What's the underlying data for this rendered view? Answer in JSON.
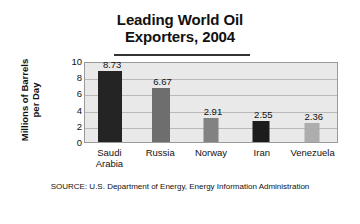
{
  "chart_data": {
    "type": "bar",
    "title": "Leading World Oil Exporters, 2004",
    "title_lines": [
      "Leading World Oil",
      "Exporters, 2004"
    ],
    "categories": [
      "Saudi Arabia",
      "Russia",
      "Norway",
      "Iran",
      "Venezuela"
    ],
    "category_lines": [
      [
        "Saudi",
        "Arabia"
      ],
      [
        "Russia"
      ],
      [
        "Norway"
      ],
      [
        "Iran"
      ],
      [
        "Venezuela"
      ]
    ],
    "values": [
      8.73,
      6.67,
      2.91,
      2.55,
      2.36
    ],
    "value_labels": [
      "8.73",
      "6.67",
      "2.91",
      "2.55",
      "2.36"
    ],
    "bar_colors": [
      "#242424",
      "#6e6e6e",
      "#828282",
      "#1c1c1c",
      "#adadad"
    ],
    "xlabel": "",
    "ylabel": "Millions of Barrels per Day",
    "ylabel_lines": [
      "Millions of Barrels",
      "per Day"
    ],
    "ylim": [
      0,
      10
    ],
    "yticks": [
      10,
      8,
      6,
      4,
      2,
      0
    ],
    "ytick_labels": [
      "10",
      "8",
      "6",
      "4",
      "2",
      "0"
    ],
    "grid": true,
    "legend": "none",
    "plot_background": "#e9e9e9",
    "gridline_color": "#b9b9b9",
    "source": "SOURCE: U.S. Department of Energy, Energy Information Administration"
  }
}
